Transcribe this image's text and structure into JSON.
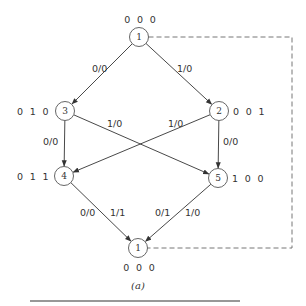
{
  "diagram": {
    "caption": "(a)",
    "nodes": [
      {
        "id": "top1",
        "label": "1",
        "state": "0 0 0",
        "cx": 139,
        "cy": 37,
        "state_x": 140,
        "state_y": 23,
        "anchor": "middle"
      },
      {
        "id": "n3",
        "label": "3",
        "state": "0 1 0",
        "cx": 65,
        "cy": 111,
        "state_x": 17,
        "state_y": 115,
        "anchor": "start"
      },
      {
        "id": "n2",
        "label": "2",
        "state": "0 0 1",
        "cx": 219,
        "cy": 111,
        "state_x": 233,
        "state_y": 115,
        "anchor": "start"
      },
      {
        "id": "n4",
        "label": "4",
        "state": "0 1 1",
        "cx": 64,
        "cy": 176,
        "state_x": 17,
        "state_y": 180,
        "anchor": "start"
      },
      {
        "id": "n5",
        "label": "5",
        "state": "1 0 0",
        "cx": 218,
        "cy": 178,
        "state_x": 232,
        "state_y": 182,
        "anchor": "start"
      },
      {
        "id": "bot1",
        "label": "1",
        "state": "0 0 0",
        "cx": 138,
        "cy": 248,
        "state_x": 139,
        "state_y": 271,
        "anchor": "middle"
      }
    ],
    "edges": [
      {
        "from": "top1",
        "to": "n3",
        "label": "0/0",
        "lx": 92,
        "ly": 72
      },
      {
        "from": "top1",
        "to": "n2",
        "label": "1/0",
        "lx": 177,
        "ly": 72
      },
      {
        "from": "n3",
        "to": "n4",
        "label": "0/0",
        "lx": 43,
        "ly": 145
      },
      {
        "from": "n3",
        "to": "n5",
        "label": "1/0",
        "lx": 107,
        "ly": 127
      },
      {
        "from": "n2",
        "to": "n4",
        "label": "1/0",
        "lx": 168,
        "ly": 127
      },
      {
        "from": "n2",
        "to": "n5",
        "label": "0/0",
        "lx": 223,
        "ly": 145
      },
      {
        "from": "n4",
        "to": "bot1",
        "label": "0/0",
        "lx": 80,
        "ly": 216,
        "label2": "1/1",
        "l2x": 110,
        "l2y": 216
      },
      {
        "from": "n5",
        "to": "bot1",
        "label": "0/1",
        "lx": 155,
        "ly": 216,
        "label2": "1/0",
        "l2x": 185,
        "l2y": 216
      }
    ],
    "feedback_dashed": {
      "x_right": 292,
      "y_top": 37,
      "y_bottom": 248
    },
    "rule": {
      "x1": 30,
      "x2": 240,
      "y": 301
    }
  }
}
